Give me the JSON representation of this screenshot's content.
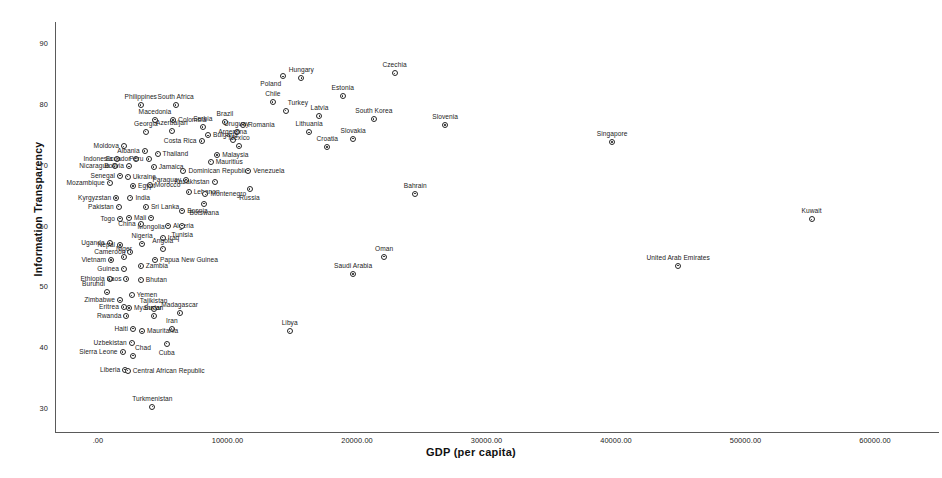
{
  "chart_data": {
    "type": "scatter",
    "title": "",
    "xlabel": "GDP (per capita)",
    "ylabel": "Information Transparency",
    "xlim": [
      -3200,
      63500
    ],
    "ylim": [
      28.0,
      92.0
    ],
    "grid": false,
    "legend": "none",
    "xticks": [
      ".00",
      "10000.00",
      "20000.00",
      "30000.00",
      "40000.00",
      "50000.00",
      "60000.00"
    ],
    "xtick_values": [
      0,
      10000,
      20000,
      30000,
      40000,
      50000,
      60000
    ],
    "yticks": [
      "30",
      "40",
      "50",
      "60",
      "70",
      "80",
      "90"
    ],
    "ytick_values": [
      30,
      40,
      50,
      60,
      70,
      80,
      90
    ],
    "point_label_field": "country",
    "points": [
      {
        "country": "Czechia",
        "x": 22900,
        "y": 85.0,
        "pos": "top"
      },
      {
        "country": "Hungary",
        "x": 15700,
        "y": 84.2,
        "pos": "top"
      },
      {
        "country": "Poland",
        "x": 14300,
        "y": 84.5,
        "pos": "bl"
      },
      {
        "country": "Estonia",
        "x": 18900,
        "y": 81.3,
        "pos": "top"
      },
      {
        "country": "Chile",
        "x": 13500,
        "y": 80.3,
        "pos": "top"
      },
      {
        "country": "Philippines",
        "x": 3300,
        "y": 79.8,
        "pos": "top"
      },
      {
        "country": "South Africa",
        "x": 6000,
        "y": 79.8,
        "pos": "top"
      },
      {
        "country": "Turkey",
        "x": 14500,
        "y": 78.9,
        "pos": "tr"
      },
      {
        "country": "Latvia",
        "x": 17100,
        "y": 78.0,
        "pos": "top"
      },
      {
        "country": "South Korea",
        "x": 21300,
        "y": 77.5,
        "pos": "top"
      },
      {
        "country": "Macedonia",
        "x": 4400,
        "y": 77.4,
        "pos": "top"
      },
      {
        "country": "Colombia",
        "x": 5800,
        "y": 77.3,
        "pos": "right"
      },
      {
        "country": "Brazil",
        "x": 9800,
        "y": 77.0,
        "pos": "top"
      },
      {
        "country": "Romania",
        "x": 11200,
        "y": 76.6,
        "pos": "right"
      },
      {
        "country": "Slovenia",
        "x": 26800,
        "y": 76.5,
        "pos": "top"
      },
      {
        "country": "Serbia",
        "x": 8100,
        "y": 76.2,
        "pos": "top"
      },
      {
        "country": "Azerbaijan",
        "x": 5700,
        "y": 75.6,
        "pos": "top"
      },
      {
        "country": "Georgia",
        "x": 3700,
        "y": 75.4,
        "pos": "top"
      },
      {
        "country": "Uruguay",
        "x": 10700,
        "y": 75.4,
        "pos": "top"
      },
      {
        "country": "Lithuania",
        "x": 16300,
        "y": 75.3,
        "pos": "top"
      },
      {
        "country": "Bulgaria",
        "x": 8500,
        "y": 74.8,
        "pos": "right"
      },
      {
        "country": "Slovakia",
        "x": 19700,
        "y": 74.3,
        "pos": "top"
      },
      {
        "country": "Argentina",
        "x": 10400,
        "y": 74.1,
        "pos": "top"
      },
      {
        "country": "Costa Rica",
        "x": 8000,
        "y": 73.9,
        "pos": "left"
      },
      {
        "country": "Croatia",
        "x": 17700,
        "y": 72.9,
        "pos": "top"
      },
      {
        "country": "Mexico",
        "x": 10900,
        "y": 73.0,
        "pos": "top"
      },
      {
        "country": "Moldova",
        "x": 2000,
        "y": 73.0,
        "pos": "left"
      },
      {
        "country": "Albania",
        "x": 3600,
        "y": 72.2,
        "pos": "left"
      },
      {
        "country": "Thailand",
        "x": 4600,
        "y": 71.8,
        "pos": "right"
      },
      {
        "country": "Malaysia",
        "x": 9200,
        "y": 71.6,
        "pos": "right"
      },
      {
        "country": "Indonesia",
        "x": 1500,
        "y": 71.0,
        "pos": "left"
      },
      {
        "country": "Ecuador",
        "x": 2900,
        "y": 71.0,
        "pos": "left"
      },
      {
        "country": "Peru",
        "x": 3900,
        "y": 70.9,
        "pos": "left"
      },
      {
        "country": "Mauritius",
        "x": 8700,
        "y": 70.5,
        "pos": "right"
      },
      {
        "country": "Nicaragua",
        "x": 1300,
        "y": 69.7,
        "pos": "left"
      },
      {
        "country": "Bolivia",
        "x": 2400,
        "y": 69.7,
        "pos": "left"
      },
      {
        "country": "Jamaica",
        "x": 4300,
        "y": 69.6,
        "pos": "right"
      },
      {
        "country": "Dominican Republic",
        "x": 6600,
        "y": 69.0,
        "pos": "right"
      },
      {
        "country": "Venezuela",
        "x": 11600,
        "y": 69.0,
        "pos": "right"
      },
      {
        "country": "Senegal",
        "x": 1700,
        "y": 68.2,
        "pos": "left"
      },
      {
        "country": "Ukraine",
        "x": 2300,
        "y": 68.0,
        "pos": "right"
      },
      {
        "country": "Paraguay",
        "x": 6800,
        "y": 67.5,
        "pos": "left"
      },
      {
        "country": "Kazakhstan",
        "x": 9000,
        "y": 67.2,
        "pos": "left"
      },
      {
        "country": "Mozambique",
        "x": 900,
        "y": 67.0,
        "pos": "left"
      },
      {
        "country": "Morocco",
        "x": 4000,
        "y": 66.7,
        "pos": "right"
      },
      {
        "country": "Egypt",
        "x": 2700,
        "y": 66.5,
        "pos": "right"
      },
      {
        "country": "Russia",
        "x": 11700,
        "y": 66.0,
        "pos": "bottom"
      },
      {
        "country": "Lebanon",
        "x": 7000,
        "y": 65.5,
        "pos": "right"
      },
      {
        "country": "Montenegro",
        "x": 8300,
        "y": 65.1,
        "pos": "right"
      },
      {
        "country": "India",
        "x": 2500,
        "y": 64.6,
        "pos": "right"
      },
      {
        "country": "Kyrgyzstan",
        "x": 1400,
        "y": 64.5,
        "pos": "left"
      },
      {
        "country": "Botswana",
        "x": 8200,
        "y": 63.6,
        "pos": "bottom"
      },
      {
        "country": "Pakistan",
        "x": 1600,
        "y": 63.1,
        "pos": "left"
      },
      {
        "country": "Sri Lanka",
        "x": 3700,
        "y": 63.0,
        "pos": "right"
      },
      {
        "country": "Bosnia",
        "x": 6500,
        "y": 62.4,
        "pos": "right"
      },
      {
        "country": "Mali",
        "x": 2400,
        "y": 61.3,
        "pos": "right"
      },
      {
        "country": "Mongolia",
        "x": 4100,
        "y": 61.3,
        "pos": "bottom"
      },
      {
        "country": "Togo",
        "x": 1700,
        "y": 61.1,
        "pos": "left"
      },
      {
        "country": "China",
        "x": 3300,
        "y": 60.2,
        "pos": "left"
      },
      {
        "country": "Algeria",
        "x": 5400,
        "y": 60.0,
        "pos": "right"
      },
      {
        "country": "Tunisia",
        "x": 6500,
        "y": 60.0,
        "pos": "bottom"
      },
      {
        "country": "Iraq",
        "x": 5000,
        "y": 58.0,
        "pos": "right"
      },
      {
        "country": "Nigeria",
        "x": 3400,
        "y": 57.0,
        "pos": "top"
      },
      {
        "country": "Uganda",
        "x": 900,
        "y": 57.1,
        "pos": "left"
      },
      {
        "country": "Nepal",
        "x": 1700,
        "y": 56.8,
        "pos": "left"
      },
      {
        "country": "Angola",
        "x": 5000,
        "y": 56.2,
        "pos": "top"
      },
      {
        "country": "Cameroon",
        "x": 2500,
        "y": 55.6,
        "pos": "left"
      },
      {
        "country": "Niger",
        "x": 2000,
        "y": 54.8,
        "pos": "top"
      },
      {
        "country": "Papua New Guinea",
        "x": 4400,
        "y": 54.4,
        "pos": "right"
      },
      {
        "country": "Vietnam",
        "x": 1000,
        "y": 54.3,
        "pos": "left"
      },
      {
        "country": "Zambia",
        "x": 3300,
        "y": 53.3,
        "pos": "right"
      },
      {
        "country": "Guinea",
        "x": 2000,
        "y": 52.9,
        "pos": "left"
      },
      {
        "country": "Oman",
        "x": 22100,
        "y": 54.9,
        "pos": "top"
      },
      {
        "country": "Saudi Arabia",
        "x": 19700,
        "y": 52.0,
        "pos": "top"
      },
      {
        "country": "United Arab Emirates",
        "x": 44800,
        "y": 53.4,
        "pos": "top"
      },
      {
        "country": "Kuwait",
        "x": 55100,
        "y": 61.0,
        "pos": "top"
      },
      {
        "country": "Singapore",
        "x": 39700,
        "y": 73.7,
        "pos": "top"
      },
      {
        "country": "Bahrain",
        "x": 24500,
        "y": 65.2,
        "pos": "top"
      },
      {
        "country": "Ethiopia",
        "x": 900,
        "y": 51.2,
        "pos": "left"
      },
      {
        "country": "Laos",
        "x": 2200,
        "y": 51.2,
        "pos": "left"
      },
      {
        "country": "Bhutan",
        "x": 3300,
        "y": 51.1,
        "pos": "right"
      },
      {
        "country": "Burundi",
        "x": 700,
        "y": 49.0,
        "pos": "tl"
      },
      {
        "country": "Yemen",
        "x": 2600,
        "y": 48.5,
        "pos": "right"
      },
      {
        "country": "Zimbabwe",
        "x": 1700,
        "y": 47.7,
        "pos": "left"
      },
      {
        "country": "Eritrea",
        "x": 2000,
        "y": 46.6,
        "pos": "left"
      },
      {
        "country": "Myanmar",
        "x": 2400,
        "y": 46.4,
        "pos": "right"
      },
      {
        "country": "Tajikistan",
        "x": 4300,
        "y": 46.3,
        "pos": "top"
      },
      {
        "country": "Madagascar",
        "x": 6300,
        "y": 45.6,
        "pos": "top"
      },
      {
        "country": "Rwanda",
        "x": 2200,
        "y": 45.1,
        "pos": "left"
      },
      {
        "country": "Sudan",
        "x": 4300,
        "y": 45.1,
        "pos": "top"
      },
      {
        "country": "Libya",
        "x": 14800,
        "y": 42.6,
        "pos": "top"
      },
      {
        "country": "Iran",
        "x": 5700,
        "y": 43.0,
        "pos": "top"
      },
      {
        "country": "Haiti",
        "x": 2700,
        "y": 43.0,
        "pos": "left"
      },
      {
        "country": "Mauritania",
        "x": 3400,
        "y": 42.6,
        "pos": "right"
      },
      {
        "country": "Uzbekistan",
        "x": 2600,
        "y": 40.7,
        "pos": "left"
      },
      {
        "country": "Cuba",
        "x": 5300,
        "y": 40.6,
        "pos": "bottom"
      },
      {
        "country": "Chad",
        "x": 2700,
        "y": 38.6,
        "pos": "tr"
      },
      {
        "country": "Sierra Leone",
        "x": 1900,
        "y": 39.2,
        "pos": "left"
      },
      {
        "country": "Liberia",
        "x": 2100,
        "y": 36.3,
        "pos": "left"
      },
      {
        "country": "Central African Republic",
        "x": 2300,
        "y": 36.1,
        "pos": "right"
      },
      {
        "country": "Turkmenistan",
        "x": 4200,
        "y": 30.2,
        "pos": "top"
      }
    ]
  }
}
